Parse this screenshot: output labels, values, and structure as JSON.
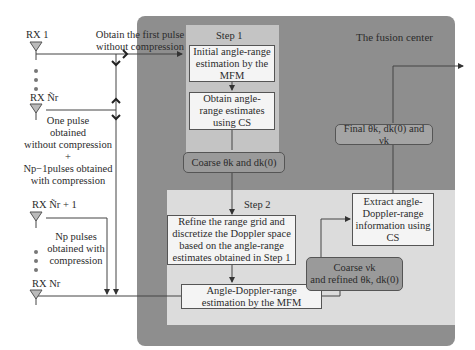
{
  "fusion_center": {
    "title": "The fusion center"
  },
  "receivers": [
    {
      "label": "RX 1"
    },
    {
      "label": "RX Ñr"
    },
    {
      "label": "RX Ñr + 1"
    },
    {
      "label": "RX Nr"
    }
  ],
  "annotations": {
    "first_pulse_line1": "Obtain the first pulse",
    "first_pulse_line2": "without compression",
    "mixed_line1": "One pulse",
    "mixed_line2": "obtained",
    "mixed_line3": "without compression",
    "mixed_plus": "+",
    "mixed_line4": "Np−1pulses obtained",
    "mixed_line5": "with compression",
    "np_line1": "Np pulses",
    "np_line2": "obtained with",
    "np_line3": "compression"
  },
  "step1": {
    "title": "Step 1",
    "box1": "Initial angle-range estimation by the MFM",
    "box2": "Obtain angle-range estimates using CS"
  },
  "coarse1": "Coarse θk and dk(0)",
  "step2": {
    "title": "Step 2",
    "box1": "Refine the range grid and discretize the Doppler space based on the angle-range estimates obtained in Step 1",
    "box2": "Angle-Doppler-range estimation by the MFM",
    "box3": "Extract angle-Doppler-range information using CS"
  },
  "coarse2": {
    "line1": "Coarse νk",
    "line2": "and refined θk, dk(0)"
  },
  "final": "Final θk, dk(0) and νk"
}
